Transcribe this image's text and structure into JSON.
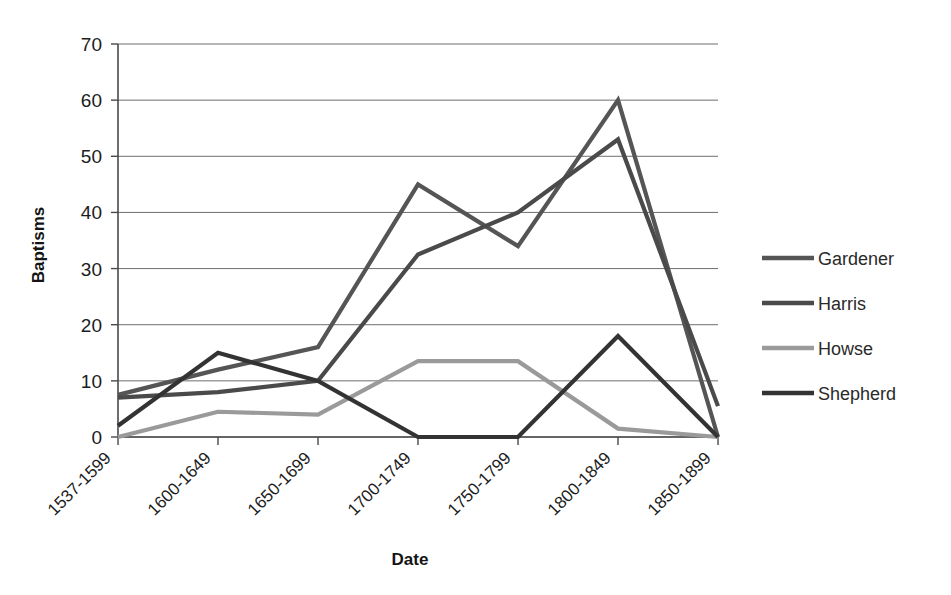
{
  "chart_data": {
    "type": "line",
    "title": "",
    "xlabel": "Date",
    "ylabel": "Baptisms",
    "categories": [
      "1537-1599",
      "1600-1649",
      "1650-1699",
      "1700-1749",
      "1750-1799",
      "1800-1849",
      "1850-1899"
    ],
    "ylim": [
      0,
      70
    ],
    "ytick_values": [
      0,
      10,
      20,
      30,
      40,
      50,
      60,
      70
    ],
    "ytick_labels": [
      "0",
      "10",
      "20",
      "30",
      "40",
      "50",
      "60",
      "70"
    ],
    "grid": "horizontal",
    "legend_position": "right",
    "series": [
      {
        "name": "Gardener",
        "color": "#555555",
        "values": [
          7.5,
          12,
          16,
          45,
          34,
          60,
          0
        ]
      },
      {
        "name": "Harris",
        "color": "#4a4a4a",
        "values": [
          7,
          8,
          10,
          32.5,
          40,
          53,
          5.5
        ]
      },
      {
        "name": "Howse",
        "color": "#9a9a9a",
        "values": [
          0,
          4.5,
          4,
          13.5,
          13.5,
          1.5,
          0
        ]
      },
      {
        "name": "Shepherd",
        "color": "#333333",
        "values": [
          2,
          15,
          10,
          0,
          0,
          18,
          0
        ]
      }
    ]
  },
  "axes": {
    "y_title": "Baptisms",
    "x_title": "Date"
  },
  "legend": {
    "entries": [
      {
        "label": "Gardener",
        "color": "#555555"
      },
      {
        "label": "Harris",
        "color": "#4a4a4a"
      },
      {
        "label": "Howse",
        "color": "#9a9a9a"
      },
      {
        "label": "Shepherd",
        "color": "#333333"
      }
    ]
  }
}
